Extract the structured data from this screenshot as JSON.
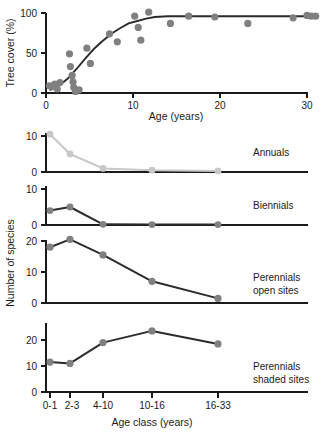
{
  "figure": {
    "colors": {
      "marker_gray": "#808080",
      "marker_light": "#c8c8c8",
      "line_dark": "#2b2b2b",
      "line_light": "#c8c8c8",
      "axis": "#1a1a1a",
      "background": "#ffffff"
    }
  },
  "chart_data": [
    {
      "type": "scatter",
      "panel": "tree-cover",
      "title": "",
      "xlabel": "Age (years)",
      "ylabel": "Tree cover (%)",
      "xlim": [
        0,
        32
      ],
      "ylim": [
        0,
        108
      ],
      "xticks": [
        0,
        10,
        20,
        30
      ],
      "xtick_labels": [
        "0",
        "10",
        "20",
        "30"
      ],
      "yticks": [
        0,
        50,
        100
      ],
      "ytick_labels": [
        "0",
        "50",
        "100"
      ],
      "grid": false,
      "legend": "none",
      "points": [
        {
          "x": 0.4,
          "y": 9
        },
        {
          "x": 0.8,
          "y": 8
        },
        {
          "x": 1.0,
          "y": 11
        },
        {
          "x": 1.3,
          "y": 5
        },
        {
          "x": 1.6,
          "y": 13
        },
        {
          "x": 2.7,
          "y": 49
        },
        {
          "x": 2.8,
          "y": 33
        },
        {
          "x": 3.0,
          "y": 22
        },
        {
          "x": 3.1,
          "y": 14
        },
        {
          "x": 3.2,
          "y": 7
        },
        {
          "x": 3.4,
          "y": 2
        },
        {
          "x": 3.8,
          "y": 4
        },
        {
          "x": 4.7,
          "y": 56
        },
        {
          "x": 5.1,
          "y": 37
        },
        {
          "x": 7.3,
          "y": 74
        },
        {
          "x": 8.2,
          "y": 64
        },
        {
          "x": 10.2,
          "y": 96
        },
        {
          "x": 10.6,
          "y": 82
        },
        {
          "x": 10.9,
          "y": 66
        },
        {
          "x": 11.8,
          "y": 101
        },
        {
          "x": 14.3,
          "y": 87
        },
        {
          "x": 16.4,
          "y": 96
        },
        {
          "x": 19.4,
          "y": 95
        },
        {
          "x": 23.2,
          "y": 87
        },
        {
          "x": 28.4,
          "y": 94
        },
        {
          "x": 30.0,
          "y": 97
        },
        {
          "x": 30.5,
          "y": 96
        },
        {
          "x": 31.0,
          "y": 96
        }
      ],
      "fit_curve": [
        {
          "x": 0.5,
          "y": 4
        },
        {
          "x": 1.5,
          "y": 9
        },
        {
          "x": 2.5,
          "y": 18
        },
        {
          "x": 3.5,
          "y": 30
        },
        {
          "x": 4.5,
          "y": 43
        },
        {
          "x": 5.5,
          "y": 55
        },
        {
          "x": 6.5,
          "y": 65
        },
        {
          "x": 7.5,
          "y": 74
        },
        {
          "x": 8.5,
          "y": 81
        },
        {
          "x": 9.5,
          "y": 87
        },
        {
          "x": 10.5,
          "y": 90
        },
        {
          "x": 11.5,
          "y": 93
        },
        {
          "x": 12.5,
          "y": 95
        },
        {
          "x": 14.0,
          "y": 96
        },
        {
          "x": 16.0,
          "y": 96
        },
        {
          "x": 20.0,
          "y": 96
        },
        {
          "x": 25.0,
          "y": 96
        },
        {
          "x": 31.0,
          "y": 96
        }
      ]
    },
    {
      "type": "line",
      "panel": "annuals",
      "label": "Annuals",
      "ylabel": "Number of species",
      "categories": [
        "0-1",
        "2-3",
        "4-10",
        "10-16",
        "16-33"
      ],
      "values": [
        10.5,
        5.0,
        1.0,
        0.5,
        0.3
      ],
      "ylim": [
        0,
        12
      ],
      "yticks": [
        0,
        10
      ],
      "ytick_labels": [
        "0",
        "10"
      ],
      "color": "#c8c8c8",
      "grid": false
    },
    {
      "type": "line",
      "panel": "biennials",
      "label": "Biennials",
      "ylabel": "Number of species",
      "categories": [
        "0-1",
        "2-3",
        "4-10",
        "10-16",
        "16-33"
      ],
      "values": [
        4.0,
        5.0,
        0.2,
        0.1,
        0.1
      ],
      "ylim": [
        0,
        12
      ],
      "yticks": [
        0,
        10
      ],
      "ytick_labels": [
        "0",
        "10"
      ],
      "color": "#2b2b2b",
      "grid": false
    },
    {
      "type": "line",
      "panel": "perennials-open",
      "label": "Perennials open sites",
      "label_line1": "Perennials",
      "label_line2": "open sites",
      "ylabel": "Number of species",
      "categories": [
        "0-1",
        "2-3",
        "4-10",
        "10-16",
        "16-33"
      ],
      "values": [
        18.0,
        20.5,
        15.5,
        7.0,
        1.5
      ],
      "ylim": [
        0,
        23
      ],
      "yticks": [
        0,
        10,
        20
      ],
      "ytick_labels": [
        "0",
        "10",
        "20"
      ],
      "color": "#2b2b2b",
      "grid": false
    },
    {
      "type": "line",
      "panel": "perennials-shaded",
      "label": "Perennials shaded sites",
      "label_line1": "Perennials",
      "label_line2": "shaded sites",
      "ylabel": "Number of species",
      "xlabel": "Age class (years)",
      "categories": [
        "0-1",
        "2-3",
        "4-10",
        "10-16",
        "16-33"
      ],
      "values": [
        11.5,
        11.0,
        19.0,
        23.5,
        18.5
      ],
      "ylim": [
        0,
        26
      ],
      "yticks": [
        0,
        10,
        20
      ],
      "ytick_labels": [
        "0",
        "10",
        "20"
      ],
      "color": "#2b2b2b",
      "grid": false
    }
  ],
  "labels": {
    "y_axis_shared": "Number of species",
    "x_axis_bottom": "Age class (years)",
    "x_axis_top": "Age (years)",
    "y_axis_top": "Tree cover (%)",
    "annuals": "Annuals",
    "biennials": "Biennials",
    "perennials_open_1": "Perennials",
    "perennials_open_2": "open sites",
    "perennials_shaded_1": "Perennials",
    "perennials_shaded_2": "shaded sites",
    "tick_0_1": "0-1",
    "tick_2_3": "2-3",
    "tick_4_10": "4-10",
    "tick_10_16": "10-16",
    "tick_16_33": "16-33",
    "top_x_0": "0",
    "top_x_10": "10",
    "top_x_20": "20",
    "top_x_30": "30",
    "top_y_0": "0",
    "top_y_50": "50",
    "top_y_100": "100",
    "n_0": "0",
    "n_10": "10",
    "n_20": "20"
  }
}
